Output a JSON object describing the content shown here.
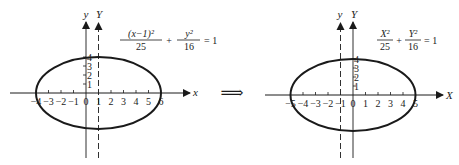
{
  "left_graph": {
    "equation": {
      "num1": "(x−1)²",
      "den1": "25",
      "plus": "+",
      "num2": "y²",
      "den2": "16",
      "rhs": "= 1"
    },
    "axis_labels": {
      "x": "x",
      "y": "y",
      "Y": "Y"
    },
    "x_ticks": [
      "−4",
      "−3",
      "−2",
      "−1",
      "0",
      "1",
      "2",
      "3",
      "4",
      "5",
      "6"
    ],
    "y_ticks": [
      "1",
      "2",
      "3",
      "4"
    ]
  },
  "arrow": "⟹",
  "right_graph": {
    "equation": {
      "num1": "X²",
      "den1": "25",
      "plus": "+",
      "num2": "Y²",
      "den2": "16",
      "rhs": "= 1"
    },
    "axis_labels": {
      "X": "X",
      "y": "y",
      "Y": "Y"
    },
    "x_ticks": [
      "−5",
      "−4",
      "−3",
      "−2",
      "−1",
      "0",
      "1",
      "2",
      "3",
      "4",
      "5"
    ],
    "y_ticks": [
      "1",
      "2",
      "3",
      "4"
    ]
  },
  "colors": {
    "ink": "#1a1a1a",
    "background": "#ffffff"
  }
}
